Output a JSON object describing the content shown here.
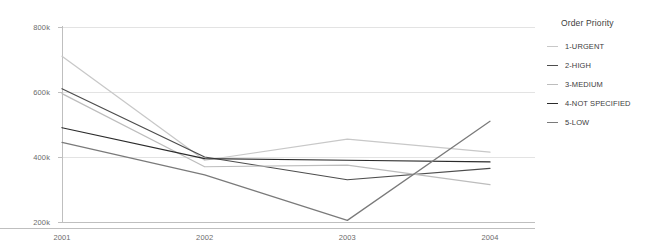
{
  "chart_data": {
    "type": "line",
    "title": "",
    "xlabel": "",
    "ylabel": "",
    "categories": [
      "2001",
      "2002",
      "2003",
      "2004"
    ],
    "x_tick_labels": [
      "2001",
      "2002",
      "2003",
      "2004"
    ],
    "y_tick_labels": [
      "800k",
      "600k",
      "400k",
      "200k"
    ],
    "y_tick_values": [
      800000,
      600000,
      400000,
      200000
    ],
    "ylim": [
      160000,
      820000
    ],
    "grid": "horizontal",
    "legend_position": "right",
    "legend_title": "Order Priority",
    "series": [
      {
        "name": "1-URGENT",
        "color": "#c8c8c8",
        "values": [
          710000,
          390000,
          455000,
          415000
        ]
      },
      {
        "name": "2-HIGH",
        "color": "#4d4d4d",
        "values": [
          610000,
          400000,
          330000,
          365000
        ]
      },
      {
        "name": "3-MEDIUM",
        "color": "#bdbdbd",
        "values": [
          595000,
          370000,
          375000,
          315000
        ]
      },
      {
        "name": "4-NOT SPECIFIED",
        "color": "#2b2b2b",
        "values": [
          490000,
          395000,
          390000,
          385000
        ]
      },
      {
        "name": "5-LOW",
        "color": "#7a7a7a",
        "values": [
          445000,
          345000,
          205000,
          510000
        ]
      }
    ]
  },
  "colors": {
    "grid": "#e3e3e3",
    "axis": "#bfbfbf",
    "tick_text": "#6b6b6b",
    "legend_text": "#3c3c3c",
    "background": "#ffffff"
  }
}
